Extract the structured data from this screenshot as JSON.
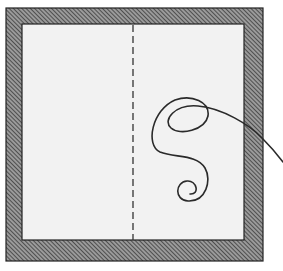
{
  "illustration": {
    "subject": "square frame with dashed fold line and loose thread",
    "colors": {
      "background": "#ffffff",
      "frame_fill": "#8a8a8a",
      "frame_hatch": "#333333",
      "panel": "#f2f2f2",
      "ink": "#2a2a2a"
    }
  }
}
